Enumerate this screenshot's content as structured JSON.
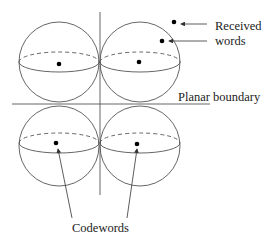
{
  "diagram": {
    "labels": {
      "received_line1": "Received",
      "received_line2": "words",
      "planar_boundary": "Planar boundary",
      "codewords": "Codewords"
    },
    "spheres": [
      {
        "id": "top-left",
        "cx": 59,
        "cy": 62,
        "r": 40,
        "dot": [
          59,
          64
        ]
      },
      {
        "id": "top-right",
        "cx": 140,
        "cy": 62,
        "r": 40,
        "dot": [
          139,
          62
        ]
      },
      {
        "id": "bottom-left",
        "cx": 59,
        "cy": 146,
        "r": 40,
        "dot": [
          56,
          143
        ]
      },
      {
        "id": "bottom-right",
        "cx": 140,
        "cy": 146,
        "r": 40,
        "dot": [
          137,
          144
        ]
      }
    ],
    "received_points": [
      [
        174,
        22
      ],
      [
        162,
        41
      ]
    ],
    "colors": {
      "stroke": "#555555",
      "dot": "#000000",
      "text": "#222222"
    }
  }
}
